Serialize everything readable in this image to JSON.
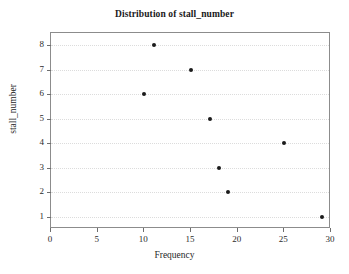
{
  "figure": {
    "background_color": "#ffffff",
    "plot_border_color": "#8c8c8c",
    "grid_color": "#dcdcdc",
    "marker_color": "#1b1b1b"
  },
  "chart_data": {
    "type": "scatter",
    "title": "Distribution of stall_number",
    "xlabel": "Frequency",
    "ylabel": "stall_number",
    "xlim": [
      0,
      30
    ],
    "ylim": [
      0.5,
      8.5
    ],
    "xticks": [
      0,
      5,
      10,
      15,
      20,
      25,
      30
    ],
    "xtick_labels": [
      "0",
      "5",
      "10",
      "15",
      "20",
      "25",
      "30"
    ],
    "yticks": [
      1,
      2,
      3,
      4,
      5,
      6,
      7,
      8
    ],
    "ytick_labels": [
      "1",
      "2",
      "3",
      "4",
      "5",
      "6",
      "7",
      "8"
    ],
    "grid": true,
    "grid_axis": "y",
    "legend": null,
    "x": [
      11,
      15,
      10,
      17,
      25,
      18,
      19,
      29
    ],
    "y": [
      8,
      7,
      6,
      5,
      4,
      3,
      2,
      1
    ],
    "points": [
      {
        "x": 11,
        "y": 8
      },
      {
        "x": 15,
        "y": 7
      },
      {
        "x": 10,
        "y": 6
      },
      {
        "x": 17,
        "y": 5
      },
      {
        "x": 25,
        "y": 4
      },
      {
        "x": 18,
        "y": 3
      },
      {
        "x": 19,
        "y": 2
      },
      {
        "x": 29,
        "y": 1
      }
    ]
  }
}
